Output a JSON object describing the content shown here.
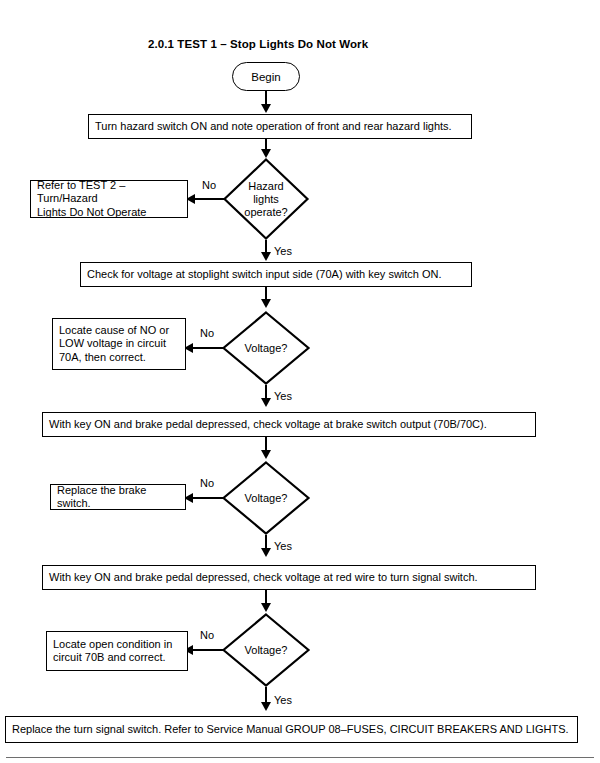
{
  "document": {
    "title": "2.0.1 TEST 1 – Stop Lights Do Not Work",
    "type": "troubleshooting-flowchart",
    "ink_color": "#000000",
    "background_color": "#ffffff"
  },
  "flowchart": {
    "start": {
      "shape": "terminator",
      "label": "Begin"
    },
    "steps": [
      {
        "id": "step-1",
        "shape": "process",
        "text": "Turn hazard switch ON and note operation of front and rear hazard lights."
      },
      {
        "id": "decision-1",
        "shape": "decision",
        "question": "Hazard lights operate?",
        "question_lines": [
          "Hazard",
          "lights",
          "operate?"
        ],
        "no_label": "No",
        "yes_label": "Yes",
        "no_target": {
          "id": "outcome-1",
          "shape": "process",
          "text": "Refer to TEST 2 – Turn/Hazard Lights Do Not Operate",
          "lines": [
            "Refer to TEST 2 – Turn/Hazard",
            "Lights Do Not Operate"
          ]
        }
      },
      {
        "id": "step-2",
        "shape": "process",
        "text": "Check for voltage at stoplight switch input side (70A) with key switch ON."
      },
      {
        "id": "decision-2",
        "shape": "decision",
        "question": "Voltage?",
        "question_lines": [
          "Voltage?"
        ],
        "no_label": "No",
        "yes_label": "Yes",
        "no_target": {
          "id": "outcome-2",
          "shape": "process",
          "text": "Locate cause of NO or LOW voltage in circuit 70A, then correct.",
          "lines": [
            "Locate cause of NO or",
            "LOW voltage in circuit",
            "70A, then correct."
          ]
        }
      },
      {
        "id": "step-3",
        "shape": "process",
        "text": "With key ON and brake pedal depressed, check voltage at brake switch output (70B/70C)."
      },
      {
        "id": "decision-3",
        "shape": "decision",
        "question": "Voltage?",
        "question_lines": [
          "Voltage?"
        ],
        "no_label": "No",
        "yes_label": "Yes",
        "no_target": {
          "id": "outcome-3",
          "shape": "process",
          "text": "Replace the brake switch.",
          "lines": [
            "Replace the brake switch."
          ]
        }
      },
      {
        "id": "step-4",
        "shape": "process",
        "text": "With key ON and brake pedal depressed, check voltage at red wire to turn signal switch."
      },
      {
        "id": "decision-4",
        "shape": "decision",
        "question": "Voltage?",
        "question_lines": [
          "Voltage?"
        ],
        "no_label": "No",
        "yes_label": "Yes",
        "no_target": {
          "id": "outcome-4",
          "shape": "process",
          "text": "Locate open condition in circuit 70B and correct.",
          "lines": [
            "Locate open condition in",
            "circuit 70B and correct."
          ]
        }
      }
    ],
    "end": {
      "id": "final-step",
      "shape": "process",
      "text": "Replace the turn signal switch. Refer to Service Manual GROUP 08–FUSES, CIRCUIT BREAKERS AND LIGHTS."
    }
  }
}
